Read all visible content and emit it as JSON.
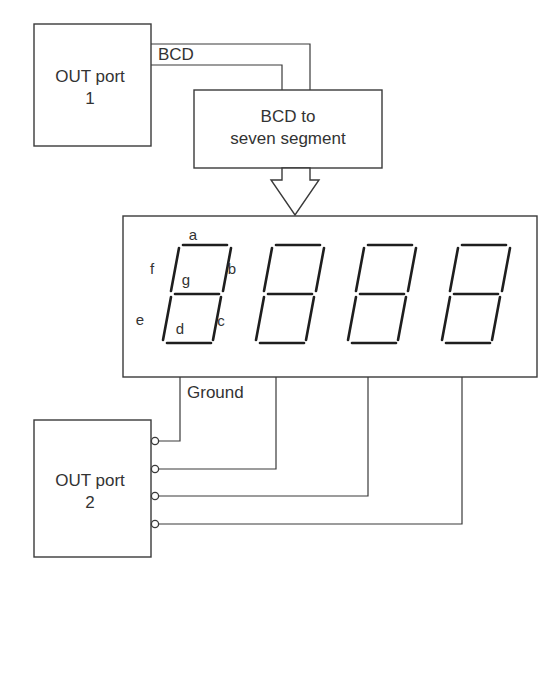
{
  "diagram": {
    "out_port_1": {
      "line1": "OUT port",
      "line2": "1"
    },
    "bcd_bus_label": "BCD",
    "decoder": {
      "line1": "BCD to",
      "line2": "seven segment"
    },
    "display": {
      "digit_count": 4,
      "segment_labels": {
        "a": "a",
        "b": "b",
        "c": "c",
        "d": "d",
        "e": "e",
        "f": "f",
        "g": "g"
      }
    },
    "ground_label": "Ground",
    "out_port_2": {
      "line1": "OUT port",
      "line2": "2",
      "pin_count": 4
    }
  }
}
